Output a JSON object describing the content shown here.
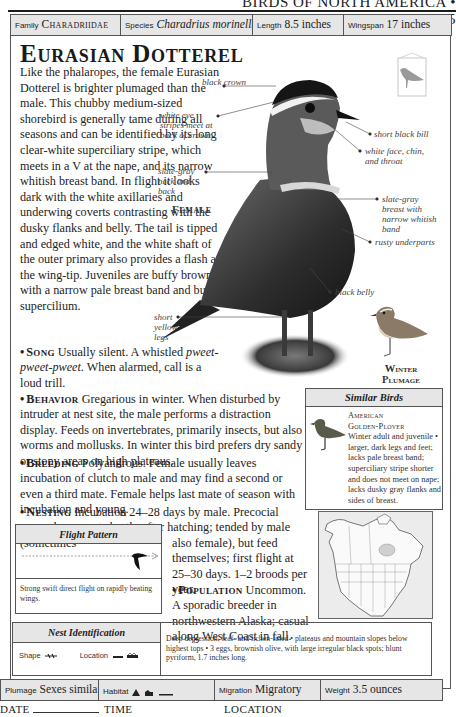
{
  "running_head": "BIRDS OF NORTH AMERICA • 225",
  "top_bar": {
    "family": {
      "label": "Family",
      "value": "Charadriidae"
    },
    "species": {
      "label": "Species",
      "value": "Charadrius morinellus"
    },
    "length": {
      "label": "Length",
      "value": "8.5 inches"
    },
    "wingspan": {
      "label": "Wingspan",
      "value": "17 inches"
    }
  },
  "title": "Eurasian Dotterel",
  "intro": "Like the phalaropes, the female Eurasian Dotterel is brighter plumaged than the male. This chubby medium-sized shorebird is generally tame during all seasons and can be identified by its long clear-white superciliary stripe, which meets in a V at the nape, and its narrow whitish breast band. In flight it looks dark with the white axillaries and underwing coverts contrasting with the dusky flanks and belly. The tail is tipped and edged white, and the white shaft of the outer primary also provides a flash at the wing-tip. Juveniles are buffy brown with a narrow pale breast band and buff supercilium.",
  "sections": {
    "song": {
      "key": "Song",
      "text_pre": "Usually silent. A whistled ",
      "text_italic": "pweet-pweet-pweet.",
      "text_post": " When alarmed, call is a loud trill."
    },
    "behavior": {
      "key": "Behavior",
      "text": "Gregarious in winter. When disturbed by intruder at nest site, the male performs a distraction display. Feeds on invertebrates, primarily insects, but also worms and mollusks. In winter this bird prefers dry sandy or stony areas on high plateaus."
    },
    "breeding": {
      "key": "Breeding",
      "text": "Polyandrous. Female usually leaves incubation of clutch to male and may find a second or even a third mate. Female helps last mate of season with incubation and young."
    },
    "nesting": {
      "key": "Nesting",
      "text_a": "Incubation 24–28 days by male. Precocial young leave nest shortly after hatching; tended by male (sometimes",
      "text_b": "also female), but feed themselves; first flight at 25–30 days. 1–2 broods per year."
    },
    "population": {
      "key": "Population",
      "text": "Uncommon. A sporadic breeder in northwestern Alaska; casual along West Coast in fall."
    }
  },
  "illustration": {
    "main_label": "Female",
    "winter_label": "Winter Plumage",
    "callouts": [
      "black crown",
      "white eye stripes meet at back of crown",
      "short black bill",
      "white face, chin, and throat",
      "slate-gray neck and back",
      "slate-gray breast with narrow whitish band",
      "rusty underparts",
      "black belly",
      "short yellow legs"
    ]
  },
  "similar_birds": {
    "header": "Similar Birds",
    "name_line1": "American",
    "name_line2": "Golden-Plover",
    "description": "Winter adult and juvenile • larger, dark legs and feet; lacks pale breast band; superciliary stripe shorter and does not meet on nape; lacks dusky gray flanks and sides of breast."
  },
  "flight_pattern": {
    "header": "Flight Pattern",
    "description": "Strong swift direct flight on rapidly beating wings."
  },
  "nest_identification": {
    "header": "Nest Identification",
    "shape_label": "Shape",
    "location_label": "Location",
    "description": "Deep depression, leaf- and lichen-lined • plateaus and mountain slopes below highest tops • 3 eggs, brownish olive, with large irregular black spots; blunt pyriform, 1.7 inches long."
  },
  "bottom_bar": {
    "plumage": {
      "label": "Plumage",
      "value": "Sexes similar"
    },
    "habitat": {
      "label": "Habitat",
      "icons": [
        "mountain-icon",
        "tundra-icon",
        "flat-ground-icon"
      ]
    },
    "migration": {
      "label": "Migration",
      "value": "Migratory"
    },
    "weight": {
      "label": "Weight",
      "value": "3.5 ounces"
    }
  },
  "record_line": {
    "date_label": "DATE",
    "time_label": "TIME",
    "location_label": "LOCATION"
  }
}
